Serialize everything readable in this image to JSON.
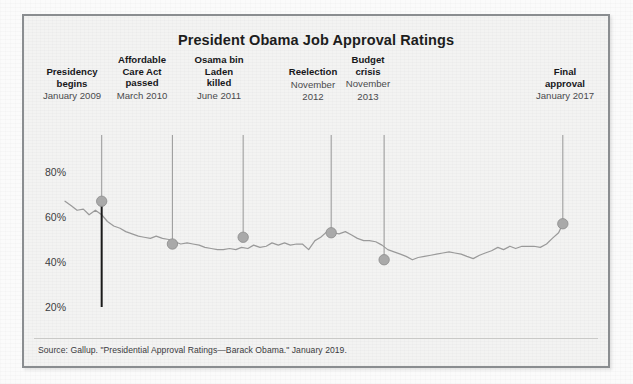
{
  "figure": {
    "title": "President Obama Job Approval Ratings",
    "source_note": "Source: Gallup. \"Presidential Approval Ratings—Barack Obama.\" January 2019.",
    "frame_color": "#8a8d90",
    "paper_color": "#f3f3f2"
  },
  "annotations": [
    {
      "title": "Presidency begins",
      "title_line1": "Presidency",
      "title_line2": "begins",
      "date": "January 2009",
      "x_pct": 7.0,
      "value": 67
    },
    {
      "title": "Affordable Care Act passed",
      "title_line1": "Affordable",
      "title_line2": "Care Act",
      "title_line3": "passed",
      "date": "March 2010",
      "x_pct": 20.5,
      "value": 48
    },
    {
      "title": "Osama bin Laden killed",
      "title_line1": "Osama bin",
      "title_line2": "Laden",
      "title_line3": "killed",
      "date": "June 2011",
      "x_pct": 34.0,
      "value": 51
    },
    {
      "title": "Reelection",
      "title_line1": "Reelection",
      "date_line1": "November",
      "date_line2": "2012",
      "date": "November 2012",
      "x_pct": 50.8,
      "value": 53
    },
    {
      "title": "Budget crisis",
      "title_line1": "Budget",
      "title_line2": "crisis",
      "date_line1": "November",
      "date_line2": "2013",
      "date": "November 2013",
      "x_pct": 60.9,
      "value": 41
    },
    {
      "title": "Final approval",
      "title_line1": "Final",
      "title_line2": "approval",
      "date": "January 2017",
      "x_pct": 95.0,
      "value": 57
    }
  ],
  "chart_data": {
    "type": "line",
    "title": "President Obama Job Approval Ratings",
    "xlabel": "",
    "ylabel": "Approval rating",
    "ylim": [
      15,
      85
    ],
    "ytick_labels": [
      "80%",
      "60%",
      "40%",
      "20%"
    ],
    "ytick_values": [
      80,
      60,
      40,
      20
    ],
    "grid": false,
    "legend": "none",
    "line_color": "#9a9a9a",
    "marker_color": "#a9a9a9",
    "marker_edge_color": "#8c8c8c",
    "callout_line_color": "#9e9e9e",
    "axis_color": "#1a1a1a",
    "x_range_label": [
      "January 2009",
      "January 2017"
    ],
    "series": [
      {
        "name": "Gallup job approval",
        "x": [
          0.0,
          1.2,
          2.3,
          3.5,
          4.6,
          5.8,
          7.0,
          8.1,
          9.3,
          10.5,
          11.6,
          12.8,
          14.0,
          15.1,
          16.3,
          17.4,
          18.6,
          19.8,
          20.9,
          22.1,
          23.3,
          24.4,
          25.6,
          26.7,
          27.9,
          29.1,
          30.2,
          31.4,
          32.6,
          33.7,
          34.9,
          36.0,
          37.2,
          38.4,
          39.5,
          40.7,
          41.9,
          43.0,
          44.2,
          45.3,
          46.5,
          47.7,
          48.8,
          50.0,
          51.2,
          52.3,
          53.5,
          54.7,
          55.8,
          57.0,
          58.1,
          59.3,
          60.5,
          61.6,
          62.8,
          64.0,
          65.1,
          66.3,
          67.4,
          68.6,
          69.8,
          70.9,
          72.1,
          73.3,
          74.4,
          75.6,
          76.7,
          77.9,
          79.1,
          80.2,
          81.4,
          82.6,
          83.7,
          84.9,
          86.0,
          87.2,
          88.4,
          89.5,
          90.7,
          91.9,
          93.0,
          94.2,
          95.0
        ],
        "values": [
          67,
          65,
          63,
          63.5,
          61,
          63,
          61,
          58,
          56,
          55,
          53.5,
          52.5,
          51.5,
          51,
          50.5,
          51.5,
          50.5,
          50,
          49,
          48,
          48.5,
          48,
          47.5,
          46.5,
          46,
          45.5,
          45.5,
          46,
          45.5,
          46.5,
          46,
          47.5,
          46.5,
          47,
          48.5,
          47.5,
          48.5,
          47.5,
          48,
          48,
          45.5,
          49.5,
          51,
          53.5,
          53,
          52.5,
          53.5,
          52,
          50.5,
          49.5,
          49.5,
          49,
          47.5,
          45.5,
          44.5,
          43.5,
          42.5,
          41,
          42,
          42.5,
          43,
          43.5,
          44,
          44.5,
          44,
          43.5,
          42.5,
          41.5,
          43,
          44,
          45,
          46.5,
          45.5,
          47,
          46,
          47,
          47,
          47,
          46.5,
          48,
          50.5,
          53,
          57
        ]
      }
    ],
    "markers": [
      {
        "label": "Presidency begins",
        "x_pct": 7.0,
        "value": 67
      },
      {
        "label": "Affordable Care Act passed",
        "x_pct": 20.5,
        "value": 48
      },
      {
        "label": "Osama bin Laden killed",
        "x_pct": 34.0,
        "value": 51
      },
      {
        "label": "Reelection",
        "x_pct": 50.8,
        "value": 53
      },
      {
        "label": "Budget crisis",
        "x_pct": 60.9,
        "value": 41
      },
      {
        "label": "Final approval",
        "x_pct": 95.0,
        "value": 57
      }
    ]
  }
}
